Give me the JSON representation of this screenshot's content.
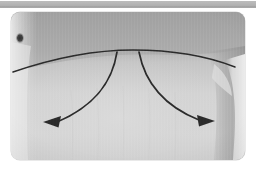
{
  "page": {
    "background_color": "#ffffff"
  },
  "top_bar": {
    "name": "header-band",
    "color": "#b4b4b4",
    "label": ""
  },
  "photo": {
    "alt": "Grayscale clinical photograph of a lower torso with a drawn incision line and two curved arrows",
    "frame": {
      "x": 11,
      "y": 12,
      "width": 234,
      "height": 148,
      "corner_radius": 9,
      "border_color": "#aaaaaa"
    },
    "tones": {
      "upper_skin": "#a9a9a9",
      "lower_skin": "#d2d2d2",
      "left_highlight": "#e6e6e6",
      "right_shadow": "#9a9a9a",
      "right_highlight": "#e2e2e2",
      "marking_ink": "#2b2b2b",
      "mole": "#3a3a3a"
    },
    "annotations": {
      "incision_line": {
        "label": "incision-marking-line",
        "description": "Gently convex horizontal line drawn across the abdomen"
      },
      "arrow_left": {
        "label": "arrow-left",
        "direction": "down-left",
        "description": "Curved arrow sweeping from midline down and to the left"
      },
      "arrow_right": {
        "label": "arrow-right",
        "direction": "down-right",
        "description": "Curved arrow sweeping from midline down and to the right"
      },
      "skin_lesion": {
        "label": "skin-lesion-mole",
        "description": "Small dark nevus on the upper-left of the field"
      }
    }
  }
}
